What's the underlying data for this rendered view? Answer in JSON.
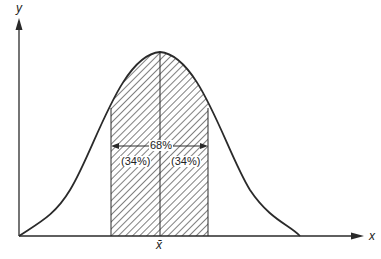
{
  "diagram": {
    "axes": {
      "y_label": "y",
      "x_label": "x",
      "mean_label": "x̄"
    },
    "annotations": {
      "total_percent": "68%",
      "left_percent": "(34%)",
      "right_percent": "(34%)"
    },
    "colors": {
      "line": "#2a2a2a",
      "hatch": "#3a3a3a",
      "background": "#ffffff"
    }
  }
}
